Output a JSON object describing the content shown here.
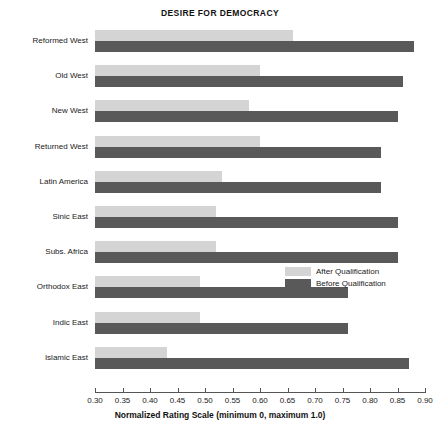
{
  "chart_data": {
    "type": "bar",
    "orientation": "horizontal",
    "title": "DESIRE FOR DEMOCRACY",
    "xlabel": "Normalized Rating Scale (minimum 0, maximum 1.0)",
    "ylabel": "",
    "xlim": [
      0.3,
      0.9
    ],
    "xticks": [
      "0.30",
      "0.35",
      "0.40",
      "0.45",
      "0.50",
      "0.55",
      "0.60",
      "0.65",
      "0.70",
      "0.75",
      "0.80",
      "0.85",
      "0.90"
    ],
    "grid": false,
    "legend_position": "middle-right",
    "categories": [
      "Reformed West",
      "Old West",
      "New West",
      "Returned West",
      "Latin America",
      "Sinic East",
      "Subs. Africa",
      "Orthodox East",
      "Indic East",
      "Islamic East"
    ],
    "series": [
      {
        "name": "After Qualification",
        "color": "#d4d4d4",
        "values": [
          0.66,
          0.6,
          0.58,
          0.6,
          0.53,
          0.52,
          0.52,
          0.49,
          0.49,
          0.43
        ]
      },
      {
        "name": "Before Qualification",
        "color": "#595959",
        "values": [
          0.88,
          0.86,
          0.85,
          0.82,
          0.82,
          0.85,
          0.85,
          0.76,
          0.76,
          0.87
        ]
      }
    ]
  },
  "legend": {
    "entries": [
      {
        "label": "After Qualification",
        "key": "after"
      },
      {
        "label": "Before Qualification",
        "key": "before"
      }
    ]
  }
}
